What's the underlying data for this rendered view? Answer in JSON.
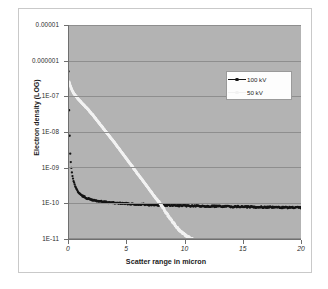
{
  "chart_data": {
    "type": "scatter",
    "title": "",
    "xlabel": "Scatter range in micron",
    "ylabel": "Electron density (LOG)",
    "yscale": "log",
    "xlim": [
      0,
      20
    ],
    "ylim": [
      1e-11,
      1e-05
    ],
    "grid": true,
    "background_color": "#b3b3b3",
    "legend_position": "upper-center",
    "xticks": [
      "0",
      "5",
      "10",
      "15",
      "20"
    ],
    "xtick_values": [
      0,
      5,
      10,
      15,
      20
    ],
    "yticks": [
      "0.00001",
      "0.000001",
      "1E-07",
      "1E-08",
      "1E-09",
      "1E-10",
      "1E-11"
    ],
    "ytick_values": [
      1e-05,
      1e-06,
      1e-07,
      1e-08,
      1e-09,
      1e-10,
      1e-11
    ],
    "series": [
      {
        "name": "100 kV",
        "color": "#141414",
        "marker": "dot",
        "x": [
          0.05,
          0.08,
          0.12,
          0.16,
          0.2,
          0.25,
          0.3,
          0.36,
          0.42,
          0.5,
          0.58,
          0.66,
          0.76,
          0.86,
          0.98,
          1.1,
          1.25,
          1.4,
          1.6,
          1.8,
          2.0,
          2.3,
          2.6,
          2.9,
          3.2,
          3.6,
          4.0,
          4.5,
          5.0,
          5.5,
          6.0,
          6.5,
          7.0,
          7.5,
          8.0,
          8.5,
          9.0,
          9.5,
          10.0,
          11.0,
          12.0,
          13.0,
          14.0,
          15.0,
          16.0,
          17.0,
          18.0,
          19.0,
          20.0
        ],
        "y": [
          5e-07,
          7e-08,
          2e-08,
          4.5e-09,
          2.2e-09,
          1.3e-09,
          9e-10,
          6.5e-10,
          5e-10,
          4e-10,
          3.3e-10,
          2.8e-10,
          2.4e-10,
          2.1e-10,
          1.9e-10,
          1.75e-10,
          1.6e-10,
          1.5e-10,
          1.4e-10,
          1.32e-10,
          1.26e-10,
          1.2e-10,
          1.15e-10,
          1.11e-10,
          1.08e-10,
          1.05e-10,
          1.02e-10,
          1e-10,
          9.8e-11,
          9.6e-11,
          9.4e-11,
          9.3e-11,
          9.1e-11,
          9e-11,
          8.9e-11,
          8.8e-11,
          8.7e-11,
          8.6e-11,
          8.5e-11,
          8.4e-11,
          8.3e-11,
          8.2e-11,
          8.1e-11,
          8e-11,
          7.9e-11,
          7.8e-11,
          7.7e-11,
          7.6e-11,
          7.5e-11
        ]
      },
      {
        "name": "50 kV",
        "color": "#f2f2f2",
        "marker": "dot",
        "x": [
          0.1,
          0.3,
          0.5,
          0.8,
          1.1,
          1.4,
          1.8,
          2.2,
          2.6,
          3.0,
          3.5,
          4.0,
          4.5,
          5.0,
          5.5,
          6.0,
          6.5,
          7.0,
          7.4,
          7.8,
          8.1,
          8.4,
          8.7,
          9.0,
          9.3,
          9.6,
          9.9,
          10.2,
          10.5,
          10.7
        ],
        "y": [
          2.5e-07,
          1.6e-07,
          1.2e-07,
          9e-08,
          7e-08,
          5.5e-08,
          4e-08,
          2.8e-08,
          1.9e-08,
          1.3e-08,
          8e-09,
          5e-09,
          3e-09,
          1.8e-09,
          1.1e-09,
          6.5e-10,
          4e-10,
          2.4e-10,
          1.6e-10,
          1.1e-10,
          8e-11,
          5.5e-11,
          4e-11,
          3e-11,
          2.2e-11,
          1.7e-11,
          1.4e-11,
          1.2e-11,
          1.05e-11,
          1e-11
        ]
      }
    ]
  },
  "legend": {
    "entries": [
      {
        "label": "100 kV"
      },
      {
        "label": "50 kV"
      }
    ]
  }
}
